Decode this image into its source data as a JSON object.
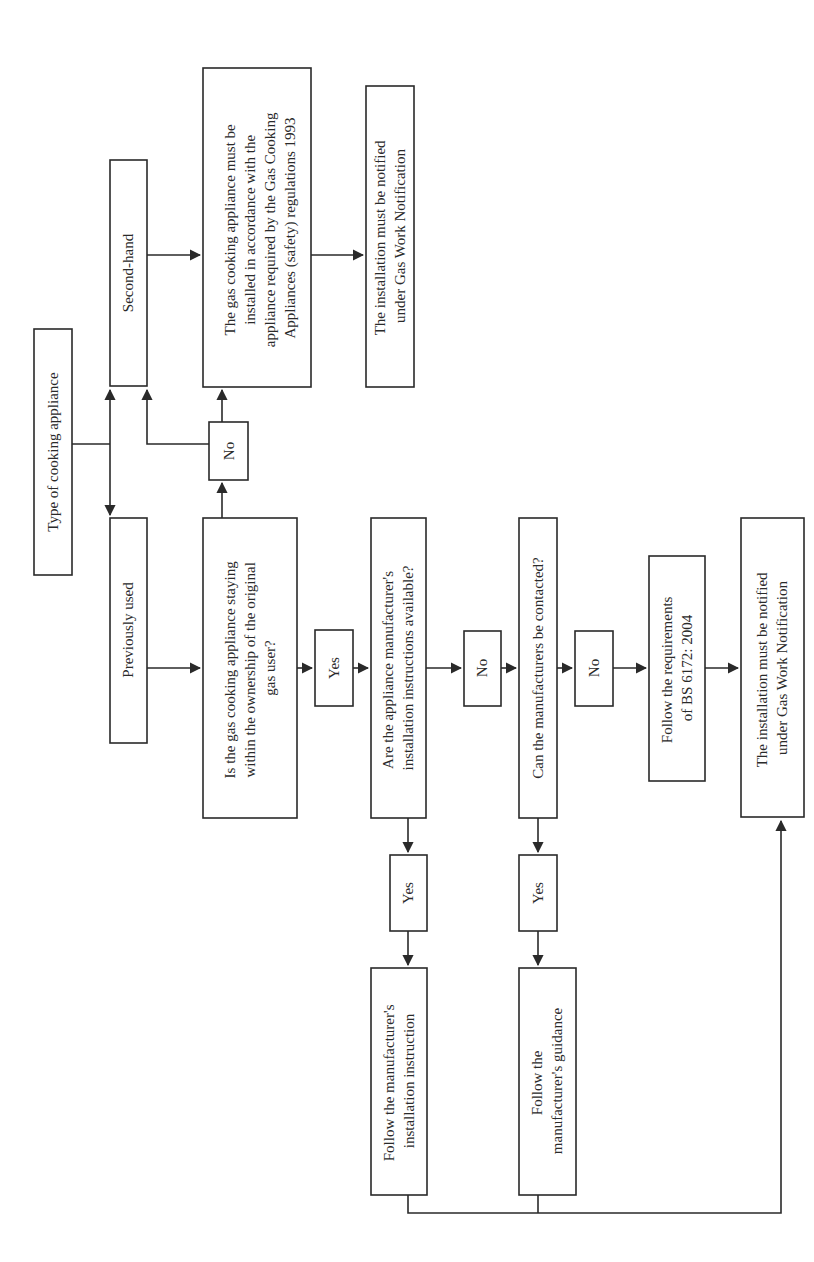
{
  "diagram": {
    "type": "flowchart",
    "orientation": "rotated-90-ccw",
    "colors": {
      "stroke": "#2a2a2a",
      "background": "#ffffff"
    },
    "nodes": {
      "type_of_appliance": {
        "lines": [
          "Type of cooking appliance"
        ]
      },
      "second_hand": {
        "lines": [
          "Second-hand"
        ]
      },
      "previously_used": {
        "lines": [
          "Previously used"
        ]
      },
      "regs_1993": {
        "lines": [
          "The gas cooking appliance must be",
          "installed in accordance with the",
          "appliance required by the Gas Cooking",
          "Appliances (safety) regulations 1993"
        ]
      },
      "notify_top": {
        "lines": [
          "The installation must be notified",
          "under Gas Work Notification"
        ]
      },
      "no_ownership": {
        "lines": [
          "No"
        ]
      },
      "ownership_q": {
        "lines": [
          "Is the gas cooking appliance staying",
          "within the ownership of the original",
          "gas user?"
        ]
      },
      "yes_ownership": {
        "lines": [
          "Yes"
        ]
      },
      "instructions_q": {
        "lines": [
          "Are the appliance manufacturer's",
          "installation instructions available?"
        ]
      },
      "no_instructions": {
        "lines": [
          "No"
        ]
      },
      "contact_q": {
        "lines": [
          "Can the manufacturers be contacted?"
        ]
      },
      "no_contact": {
        "lines": [
          "No"
        ]
      },
      "bs6172": {
        "lines": [
          "Follow the requirements",
          "of BS 6172: 2004"
        ]
      },
      "notify_bottom": {
        "lines": [
          "The installation must be notified",
          "under Gas Work Notification"
        ]
      },
      "yes_instructions": {
        "lines": [
          "Yes"
        ]
      },
      "yes_contact": {
        "lines": [
          "Yes"
        ]
      },
      "follow_instructions": {
        "lines": [
          "Follow the manufacturer's",
          "installation instruction"
        ]
      },
      "follow_guidance": {
        "lines": [
          "Follow the",
          "manufacturer's guidance"
        ]
      }
    }
  }
}
